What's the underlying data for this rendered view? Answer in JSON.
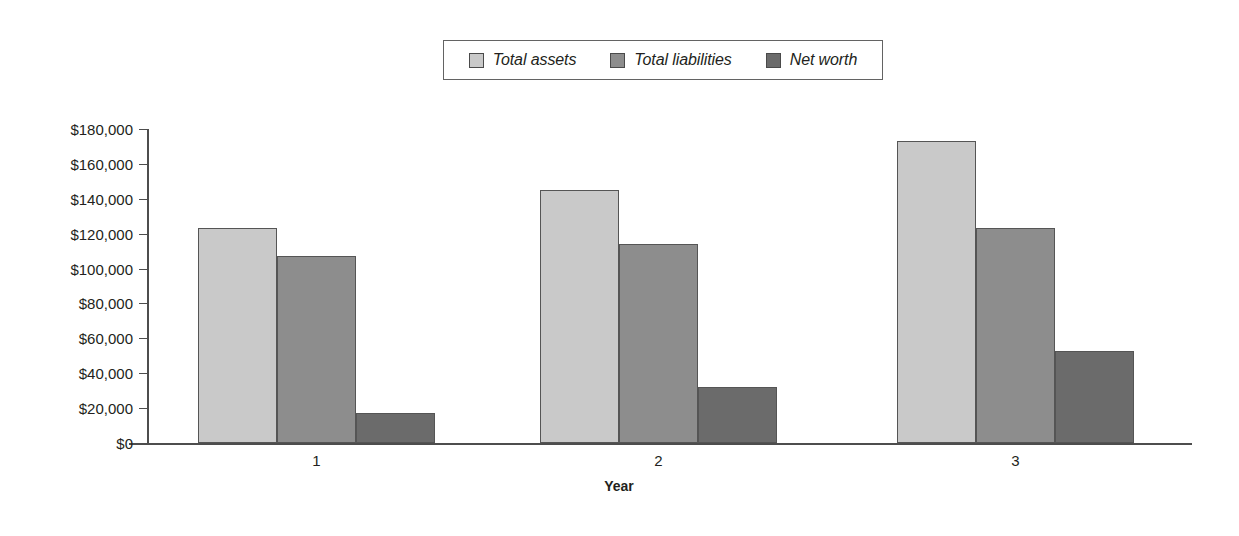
{
  "chart_data": {
    "type": "bar",
    "title": "",
    "xlabel": "Year",
    "ylabel": "",
    "categories": [
      "1",
      "2",
      "3"
    ],
    "series": [
      {
        "name": "Total assets",
        "values": [
          123000,
          145000,
          173000
        ],
        "color": "#c9c9c9"
      },
      {
        "name": "Total liabilities",
        "values": [
          107000,
          114000,
          123000
        ],
        "color": "#8d8d8d"
      },
      {
        "name": "Net worth",
        "values": [
          17000,
          32000,
          53000
        ],
        "color": "#6b6b6b"
      }
    ],
    "ylim": [
      0,
      180000
    ],
    "ytick_values": [
      0,
      20000,
      40000,
      60000,
      80000,
      100000,
      120000,
      140000,
      160000,
      180000
    ],
    "ytick_labels": [
      "$0",
      "$20,000",
      "$40,000",
      "$60,000",
      "$80,000",
      "$100,000",
      "$120,000",
      "$140,000",
      "$160,000",
      "$180,000"
    ],
    "grid": false,
    "legend_position": "top-center"
  },
  "legend": {
    "entries": [
      {
        "label": "Total assets"
      },
      {
        "label": "Total liabilities"
      },
      {
        "label": "Net worth"
      }
    ]
  },
  "axis": {
    "x_title": "Year"
  }
}
